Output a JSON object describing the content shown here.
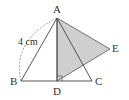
{
  "figure": {
    "points": {
      "A": {
        "label": "A",
        "x": 57,
        "y": 18
      },
      "B": {
        "label": "B",
        "x": 21,
        "y": 81
      },
      "C": {
        "label": "C",
        "x": 92,
        "y": 81
      },
      "D": {
        "label": "D",
        "x": 57,
        "y": 81
      },
      "E": {
        "label": "E",
        "x": 110,
        "y": 49
      }
    },
    "length_label": "4 cm",
    "shaded_color": "#cfcfcf",
    "line_color": "#444444",
    "right_angle_at": "D"
  }
}
